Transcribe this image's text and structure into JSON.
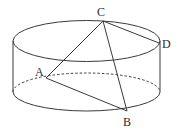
{
  "figure": {
    "type": "cylinder-with-inscribed-segments",
    "points": {
      "A": {
        "label": "A",
        "x": 46,
        "y": 78,
        "label_x": 35,
        "label_y": 76
      },
      "B": {
        "label": "B",
        "x": 127,
        "y": 111,
        "label_x": 123,
        "label_y": 126
      },
      "C": {
        "label": "C",
        "x": 103,
        "y": 21,
        "label_x": 97,
        "label_y": 16
      },
      "D": {
        "label": "D",
        "x": 159,
        "y": 43,
        "label_x": 162,
        "label_y": 48
      }
    },
    "segments": [
      "AC",
      "CB",
      "AB",
      "CD"
    ],
    "cylinder": {
      "center_x": 86.5,
      "top_center_y": 41,
      "bottom_center_y": 92,
      "rx": 73.5,
      "ry": 20,
      "left_x": 13,
      "right_x": 160
    },
    "line_color": "#3a3a3a",
    "label_color": "#2a2a2a"
  }
}
